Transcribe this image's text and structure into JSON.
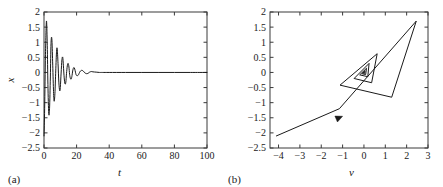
{
  "figure": {
    "background": "#ffffff",
    "line_color": "#1a1a1a",
    "axis_color": "#3a3a3a"
  },
  "panels": [
    {
      "id": "a",
      "caption": "(a)",
      "xlabel": "t",
      "ylabel": "x",
      "box": {
        "left": 44,
        "top": 12,
        "right": 207,
        "bottom": 148
      },
      "xticks": [
        "0",
        "20",
        "40",
        "60",
        "80",
        "100"
      ],
      "yticks": [
        "2",
        "1.5",
        "1",
        "0.5",
        "0",
        "-0.5",
        "-1",
        "-1.5",
        "-2",
        "-2.5"
      ]
    },
    {
      "id": "b",
      "caption": "(b)",
      "xlabel": "v",
      "ylabel": "x",
      "box": {
        "left": 48,
        "top": 12,
        "right": 206,
        "bottom": 148
      },
      "xticks": [
        "-4",
        "-3",
        "-2",
        "-1",
        "0",
        "1",
        "2",
        "3"
      ],
      "yticks": [
        "2",
        "1.5",
        "1",
        "0.5",
        "0",
        "-0.5",
        "-1",
        "-1.5",
        "-2",
        "-2.5"
      ]
    }
  ],
  "chart_data": [
    {
      "type": "line",
      "panel": "a",
      "title": "",
      "xlabel": "t",
      "ylabel": "x",
      "xlim": [
        0,
        100
      ],
      "ylim": [
        -2.5,
        2
      ],
      "xticks": [
        0,
        20,
        40,
        60,
        80,
        100
      ],
      "yticks": [
        2,
        1.5,
        1,
        0.5,
        0,
        -0.5,
        -1,
        -1.5,
        -2,
        -2.5
      ],
      "grid": false,
      "legend": null,
      "description": "Damped oscillation of x versus time t; starts near -2.1, overshoots to +1.7, oscillates with rapidly decaying amplitude and settles at 0 by about t = 35.",
      "series": [
        {
          "name": "x(t)",
          "x": [
            0.0,
            0.4,
            0.9,
            1.5,
            2.0,
            2.4,
            2.9,
            3.4,
            3.9,
            4.3,
            4.8,
            5.3,
            5.8,
            6.2,
            6.7,
            7.2,
            7.7,
            8.1,
            8.6,
            9.1,
            9.6,
            10.0,
            10.5,
            11.0,
            11.5,
            11.9,
            12.4,
            12.9,
            13.4,
            13.8,
            14.3,
            14.8,
            15.3,
            15.7,
            16.2,
            16.7,
            17.2,
            17.6,
            18.1,
            18.6,
            19.1,
            19.5,
            20.0,
            21.0,
            22.0,
            23.0,
            24.0,
            25.0,
            26.0,
            27.0,
            28.0,
            29.0,
            30.0,
            32.0,
            34.0,
            36.0,
            40.0,
            50.0,
            60.0,
            70.0,
            80.0,
            90.0,
            100.0
          ],
          "y": [
            -2.1,
            -1.2,
            0.6,
            1.7,
            0.9,
            -0.4,
            -1.35,
            -1.2,
            -0.15,
            0.95,
            1.12,
            0.35,
            -0.55,
            -0.95,
            -0.7,
            0.05,
            0.7,
            0.78,
            0.3,
            -0.32,
            -0.6,
            -0.5,
            -0.02,
            0.42,
            0.5,
            0.22,
            -0.18,
            -0.38,
            -0.32,
            -0.04,
            0.22,
            0.3,
            0.18,
            -0.06,
            -0.2,
            -0.22,
            -0.1,
            0.05,
            0.15,
            0.15,
            0.06,
            -0.04,
            -0.1,
            -0.09,
            0.02,
            0.07,
            0.05,
            -0.01,
            -0.04,
            -0.03,
            0.01,
            0.03,
            0.02,
            0.01,
            0.0,
            0.0,
            0.0,
            0.0,
            0.0,
            0.0,
            0.0,
            0.0,
            0.0
          ]
        }
      ]
    },
    {
      "type": "line",
      "panel": "b",
      "title": "",
      "xlabel": "v",
      "ylabel": "x",
      "xlim": [
        -4.4,
        3.0
      ],
      "ylim": [
        -2.5,
        2
      ],
      "xticks": [
        -4,
        -3,
        -2,
        -1,
        0,
        1,
        2,
        3
      ],
      "yticks": [
        2,
        1.5,
        1,
        0.5,
        0,
        -0.5,
        -1,
        -1.5,
        -2,
        -2.5
      ],
      "grid": false,
      "legend": null,
      "annotations": [
        "arrowhead marker on inbound trajectory near v = -1.0, x = -1.45"
      ],
      "description": "Phase-plane portrait of x versus v; a polygonal inward spiral starting at the lower-left (-4.1, -2.1) and converging to a fixed point at the origin.",
      "series": [
        {
          "name": "trajectory",
          "points": [
            [
              -4.1,
              -2.1
            ],
            [
              -1.15,
              -1.2
            ],
            [
              2.45,
              1.7
            ],
            [
              1.3,
              -0.82
            ],
            [
              -1.12,
              -0.42
            ],
            [
              0.62,
              0.62
            ],
            [
              0.36,
              -0.34
            ],
            [
              -0.46,
              -0.2
            ],
            [
              0.24,
              0.3
            ],
            [
              0.18,
              -0.14
            ],
            [
              -0.2,
              -0.08
            ],
            [
              0.12,
              0.14
            ],
            [
              0.08,
              -0.07
            ],
            [
              -0.1,
              -0.04
            ],
            [
              0.05,
              0.06
            ],
            [
              0.03,
              -0.03
            ],
            [
              -0.04,
              -0.02
            ],
            [
              0.02,
              0.02
            ],
            [
              0.0,
              0.0
            ]
          ]
        }
      ]
    }
  ]
}
